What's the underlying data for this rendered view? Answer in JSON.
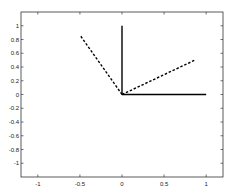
{
  "chart_data": {
    "type": "line",
    "title": "",
    "xlabel": "",
    "ylabel": "",
    "xlim": [
      -1.2,
      1.2
    ],
    "ylim": [
      -1.2,
      1.2
    ],
    "grid": false,
    "legend": null,
    "xticks": [
      -1,
      -0.5,
      0,
      0.5,
      1
    ],
    "xtick_labels": [
      "-1",
      "-0.5",
      "0",
      "0.5",
      "1"
    ],
    "yticks": [
      1,
      0.8,
      0.6,
      0.4,
      0.2,
      0,
      -0.2,
      -0.4,
      -0.6,
      -0.8,
      -1
    ],
    "ytick_labels": [
      "1",
      "0.8",
      "0.6",
      "0.4",
      "0.2",
      "0",
      "-0.2",
      "-0.4",
      "-0.6",
      "-0.8",
      "-1"
    ],
    "series": [
      {
        "name": "e1 (solid)",
        "style": "solid",
        "color": "#000000",
        "x": [
          0,
          1
        ],
        "y": [
          0,
          0
        ]
      },
      {
        "name": "e2 (solid)",
        "style": "solid",
        "color": "#000000",
        "x": [
          0,
          0
        ],
        "y": [
          0,
          1
        ]
      },
      {
        "name": "rotated e1 (dashed)",
        "style": "dashed",
        "color": "#000000",
        "x": [
          0,
          0.866
        ],
        "y": [
          0,
          0.5
        ]
      },
      {
        "name": "rotated e2 (dashed)",
        "style": "dashed",
        "color": "#000000",
        "x": [
          0,
          -0.5
        ],
        "y": [
          0,
          0.866
        ]
      }
    ]
  }
}
